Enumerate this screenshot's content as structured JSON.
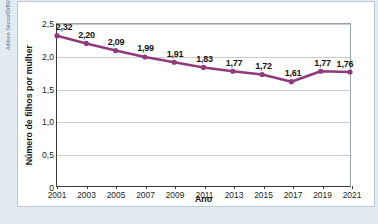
{
  "credit": {
    "text": "Adilson Secco/ID/BR"
  },
  "chart_data": {
    "type": "line",
    "title": "",
    "xlabel": "Ano",
    "ylabel": "Número de filhos por mulher",
    "categories": [
      "2001",
      "2003",
      "2005",
      "2007",
      "2009",
      "2011",
      "2013",
      "2015",
      "2017",
      "2019",
      "2021"
    ],
    "values": [
      2.32,
      2.2,
      2.09,
      1.99,
      1.91,
      1.83,
      1.77,
      1.72,
      1.61,
      1.77,
      1.76
    ],
    "point_labels": [
      "2,32",
      "2,20",
      "2,09",
      "1,99",
      "1,91",
      "1,83",
      "1,77",
      "1,72",
      "1,61",
      "1,77",
      "1,76"
    ],
    "ylim": [
      0,
      2.5
    ],
    "ytick_values": [
      0,
      0.5,
      1.0,
      1.5,
      2.0,
      2.5
    ],
    "ytick_labels": [
      "0",
      "0,5",
      "1,0",
      "1,5",
      "2,0",
      "2,5"
    ],
    "grid": true,
    "legend": "none",
    "series_color": "#8e3a7d",
    "marker": "circle",
    "gridline_color": "#c9ccd0",
    "axis_color": "#3b3b3b"
  }
}
